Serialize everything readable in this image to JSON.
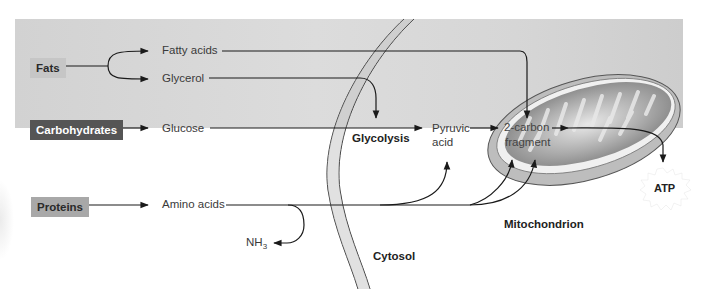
{
  "diagram": {
    "sources": {
      "fats": "Fats",
      "carbohydrates": "Carbohydrates",
      "proteins": "Proteins"
    },
    "intermediates": {
      "fatty_acids": "Fatty acids",
      "glycerol": "Glycerol",
      "glucose": "Glucose",
      "amino_acids": "Amino acids",
      "nh3_main": "NH",
      "nh3_sub": "3",
      "pyruvic_line1": "Pyruvic",
      "pyruvic_line2": "acid",
      "two_carbon_line1": "2-carbon",
      "two_carbon_line2": "fragment"
    },
    "processes": {
      "glycolysis": "Glycolysis"
    },
    "regions": {
      "cytosol": "Cytosol",
      "mitochondrion": "Mitochondrion"
    },
    "outputs": {
      "atp": "ATP"
    },
    "colors": {
      "background": "#d8d8d8",
      "carb_box": "#555555",
      "fats_box": "#c6c6c6",
      "proteins_box": "#a8a8a8",
      "arrow": "#1a1a1a"
    }
  }
}
